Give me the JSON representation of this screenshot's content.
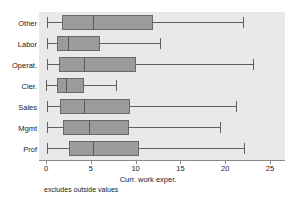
{
  "chart_data": {
    "type": "box",
    "title": "",
    "xlabel": "Curr. work exper.",
    "ylabel": "",
    "footnote": "excludes outside values",
    "xlim": [
      0,
      25
    ],
    "xticks": [
      0,
      5,
      10,
      15,
      20,
      25
    ],
    "xticklabels": [
      "0",
      "5",
      "10",
      "15",
      "20",
      "25"
    ],
    "grid": false,
    "orientation": "horizontal",
    "legend": "none",
    "panel_background": "#e9e9e9",
    "box_fill": "#9b9b9b",
    "box_edge": "#6a6a6a",
    "whisker_color": "#5e5e5e",
    "categories": [
      "Other",
      "Labor",
      "Operat.",
      "Cler.",
      "Sales",
      "Mgmt",
      "Prof"
    ],
    "boxes": [
      {
        "category": "Other",
        "whisker_low": 0.1,
        "q1": 1.8,
        "median": 5.2,
        "q3": 11.9,
        "whisker_high": 22.0
      },
      {
        "category": "Labor",
        "whisker_low": 0.1,
        "q1": 1.2,
        "median": 2.4,
        "q3": 6.0,
        "whisker_high": 12.7
      },
      {
        "category": "Operat.",
        "whisker_low": 0.1,
        "q1": 1.5,
        "median": 4.2,
        "q3": 10.0,
        "whisker_high": 23.1
      },
      {
        "category": "Cler.",
        "whisker_low": 0.0,
        "q1": 1.2,
        "median": 2.2,
        "q3": 4.2,
        "whisker_high": 7.8
      },
      {
        "category": "Sales",
        "whisker_low": 0.1,
        "q1": 1.6,
        "median": 4.2,
        "q3": 9.4,
        "whisker_high": 21.2
      },
      {
        "category": "Mgmt",
        "whisker_low": 0.1,
        "q1": 1.9,
        "median": 4.8,
        "q3": 9.3,
        "whisker_high": 19.4
      },
      {
        "category": "Prof",
        "whisker_low": 0.1,
        "q1": 2.6,
        "median": 5.3,
        "q3": 10.4,
        "whisker_high": 22.1
      }
    ]
  }
}
